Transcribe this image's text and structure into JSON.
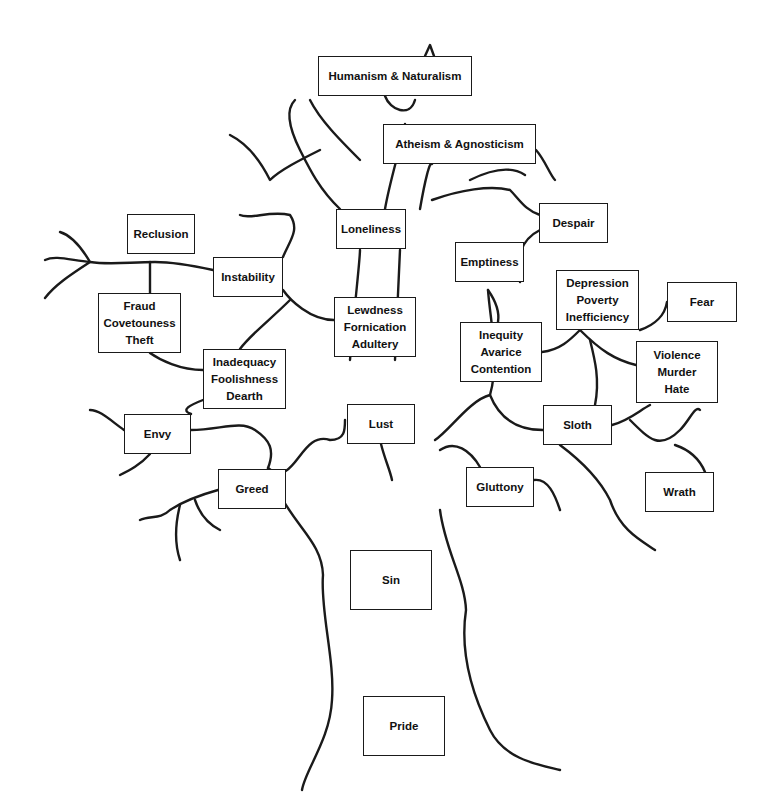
{
  "diagram": {
    "type": "labeled-tree",
    "boxes": [
      {
        "id": "humanism",
        "lines": [
          "Humanism & Naturalism"
        ],
        "x": 318,
        "y": 56,
        "w": 154,
        "h": 40
      },
      {
        "id": "atheism",
        "lines": [
          "Atheism & Agnosticism"
        ],
        "x": 383,
        "y": 124,
        "w": 153,
        "h": 40
      },
      {
        "id": "reclusion",
        "lines": [
          "Reclusion"
        ],
        "x": 127,
        "y": 214,
        "w": 68,
        "h": 40
      },
      {
        "id": "loneliness",
        "lines": [
          "Loneliness"
        ],
        "x": 336,
        "y": 209,
        "w": 70,
        "h": 40
      },
      {
        "id": "despair",
        "lines": [
          "Despair"
        ],
        "x": 539,
        "y": 203,
        "w": 69,
        "h": 40
      },
      {
        "id": "instability",
        "lines": [
          "Instability"
        ],
        "x": 213,
        "y": 257,
        "w": 70,
        "h": 40
      },
      {
        "id": "emptiness",
        "lines": [
          "Emptiness"
        ],
        "x": 455,
        "y": 242,
        "w": 69,
        "h": 40
      },
      {
        "id": "fraud",
        "lines": [
          "Fraud",
          "Covetouness",
          "Theft"
        ],
        "x": 98,
        "y": 293,
        "w": 83,
        "h": 60
      },
      {
        "id": "lewdness",
        "lines": [
          "Lewdness",
          "Fornication",
          "Adultery"
        ],
        "x": 334,
        "y": 297,
        "w": 82,
        "h": 60
      },
      {
        "id": "depression",
        "lines": [
          "Depression",
          "Poverty",
          "Inefficiency"
        ],
        "x": 556,
        "y": 270,
        "w": 83,
        "h": 60
      },
      {
        "id": "fear",
        "lines": [
          "Fear"
        ],
        "x": 667,
        "y": 282,
        "w": 70,
        "h": 40
      },
      {
        "id": "inequity",
        "lines": [
          "Inequity",
          "Avarice",
          "Contention"
        ],
        "x": 460,
        "y": 322,
        "w": 82,
        "h": 60
      },
      {
        "id": "inadequacy",
        "lines": [
          "Inadequacy",
          "Foolishness",
          "Dearth"
        ],
        "x": 203,
        "y": 349,
        "w": 83,
        "h": 60
      },
      {
        "id": "violence",
        "lines": [
          "Violence",
          "Murder",
          "Hate"
        ],
        "x": 636,
        "y": 341,
        "w": 82,
        "h": 62
      },
      {
        "id": "envy",
        "lines": [
          "Envy"
        ],
        "x": 124,
        "y": 414,
        "w": 67,
        "h": 40
      },
      {
        "id": "lust",
        "lines": [
          "Lust"
        ],
        "x": 347,
        "y": 404,
        "w": 68,
        "h": 40
      },
      {
        "id": "sloth",
        "lines": [
          "Sloth"
        ],
        "x": 543,
        "y": 405,
        "w": 69,
        "h": 40
      },
      {
        "id": "greed",
        "lines": [
          "Greed"
        ],
        "x": 218,
        "y": 469,
        "w": 68,
        "h": 40
      },
      {
        "id": "gluttony",
        "lines": [
          "Gluttony"
        ],
        "x": 466,
        "y": 467,
        "w": 68,
        "h": 40
      },
      {
        "id": "wrath",
        "lines": [
          "Wrath"
        ],
        "x": 645,
        "y": 472,
        "w": 69,
        "h": 40
      },
      {
        "id": "sin",
        "lines": [
          "Sin"
        ],
        "x": 350,
        "y": 550,
        "w": 82,
        "h": 60
      },
      {
        "id": "pride",
        "lines": [
          "Pride"
        ],
        "x": 363,
        "y": 696,
        "w": 82,
        "h": 60
      }
    ]
  },
  "colors": {
    "ink": "#1a1a1a",
    "background": "#ffffff"
  }
}
